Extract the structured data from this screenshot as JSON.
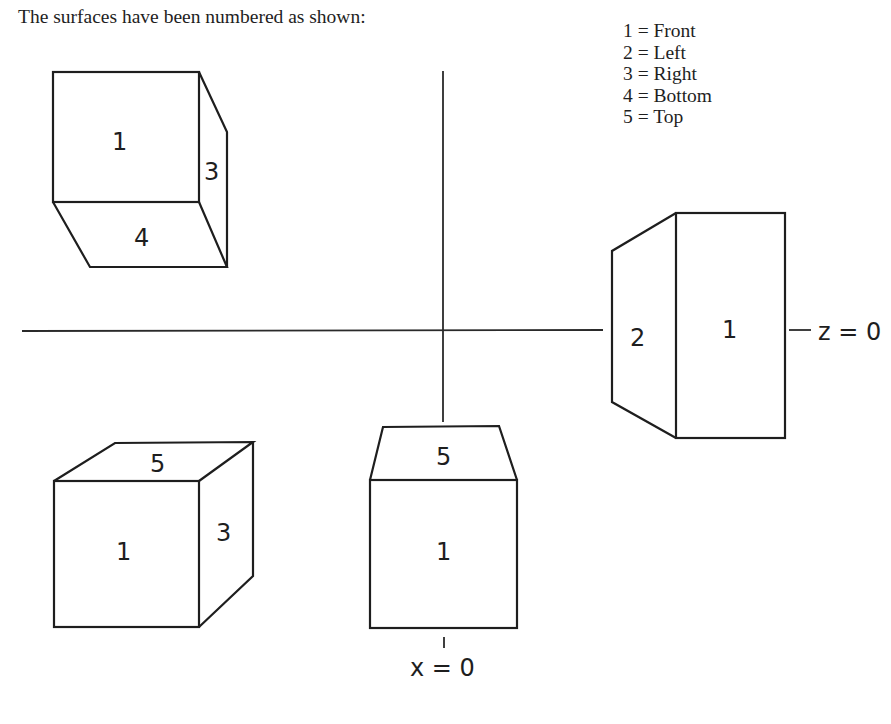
{
  "intro_text": "The surfaces have been numbered as shown:",
  "legend": {
    "items": [
      {
        "number": "1",
        "text": "1 = Front"
      },
      {
        "number": "2",
        "text": "2 = Left"
      },
      {
        "number": "3",
        "text": "3 = Right"
      },
      {
        "number": "4",
        "text": "4 = Bottom"
      },
      {
        "number": "5",
        "text": "5 = Top"
      }
    ]
  },
  "axes": {
    "z_label": "z = 0",
    "x_label": "x = 0"
  },
  "views": {
    "top_left": {
      "description": "cube viewed from above-right, showing bottom face",
      "faces": {
        "front": "1",
        "right": "3",
        "bottom": "4"
      }
    },
    "right": {
      "description": "cube viewed from left side",
      "faces": {
        "left": "2",
        "front": "1"
      }
    },
    "bottom_left": {
      "description": "cube viewed from below-right, showing top face",
      "faces": {
        "top": "5",
        "front": "1",
        "right": "3"
      }
    },
    "bottom_center": {
      "description": "cube viewed from below center",
      "faces": {
        "top": "5",
        "front": "1"
      }
    }
  }
}
